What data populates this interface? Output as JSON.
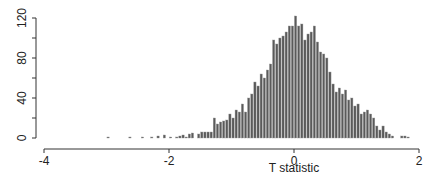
{
  "chart_data": {
    "type": "bar",
    "title": "",
    "xlabel": "T statistic",
    "ylabel": "",
    "xlim": [
      -4,
      2
    ],
    "ylim": [
      0,
      120
    ],
    "x_ticks": [
      -4,
      -2,
      0,
      2
    ],
    "x_tick_labels": [
      "-4",
      "-2",
      "0",
      "2"
    ],
    "y_ticks": [
      0,
      20,
      40,
      60,
      80,
      100,
      120
    ],
    "y_tick_labels": [
      "0",
      "",
      "40",
      "",
      "80",
      "",
      "120"
    ],
    "grid": false,
    "legend": null,
    "bin_width": 0.05,
    "bin_starts": [
      -3.0,
      -2.95,
      -2.9,
      -2.85,
      -2.8,
      -2.75,
      -2.7,
      -2.65,
      -2.6,
      -2.55,
      -2.5,
      -2.45,
      -2.4,
      -2.35,
      -2.3,
      -2.25,
      -2.2,
      -2.15,
      -2.1,
      -2.05,
      -2.0,
      -1.95,
      -1.9,
      -1.85,
      -1.8,
      -1.75,
      -1.7,
      -1.65,
      -1.6,
      -1.55,
      -1.5,
      -1.45,
      -1.4,
      -1.35,
      -1.3,
      -1.25,
      -1.2,
      -1.15,
      -1.1,
      -1.05,
      -1.0,
      -0.95,
      -0.9,
      -0.85,
      -0.8,
      -0.75,
      -0.7,
      -0.65,
      -0.6,
      -0.55,
      -0.5,
      -0.45,
      -0.4,
      -0.35,
      -0.3,
      -0.25,
      -0.2,
      -0.15,
      -0.1,
      -0.05,
      0.0,
      0.05,
      0.1,
      0.15,
      0.2,
      0.25,
      0.3,
      0.35,
      0.4,
      0.45,
      0.5,
      0.55,
      0.6,
      0.65,
      0.7,
      0.75,
      0.8,
      0.85,
      0.9,
      0.95,
      1.0,
      1.05,
      1.1,
      1.15,
      1.2,
      1.25,
      1.3,
      1.35,
      1.4,
      1.45,
      1.5,
      1.55,
      1.6,
      1.65,
      1.7,
      1.75,
      1.8,
      1.85
    ],
    "values": [
      1,
      0,
      0,
      0,
      0,
      0,
      0,
      1,
      0,
      0,
      0,
      1,
      0,
      0,
      1,
      0,
      2,
      0,
      3,
      0,
      1,
      0,
      1,
      2,
      3,
      1,
      4,
      5,
      0,
      4,
      6,
      6,
      6,
      6,
      20,
      14,
      16,
      17,
      18,
      24,
      20,
      28,
      26,
      34,
      26,
      40,
      44,
      56,
      52,
      64,
      60,
      68,
      74,
      98,
      94,
      100,
      102,
      106,
      112,
      112,
      122,
      112,
      114,
      98,
      104,
      106,
      112,
      96,
      86,
      84,
      80,
      66,
      54,
      46,
      50,
      44,
      48,
      38,
      40,
      32,
      34,
      24,
      26,
      28,
      24,
      20,
      12,
      8,
      12,
      6,
      4,
      2,
      0,
      0,
      2,
      2,
      1,
      0,
      0,
      1
    ]
  }
}
